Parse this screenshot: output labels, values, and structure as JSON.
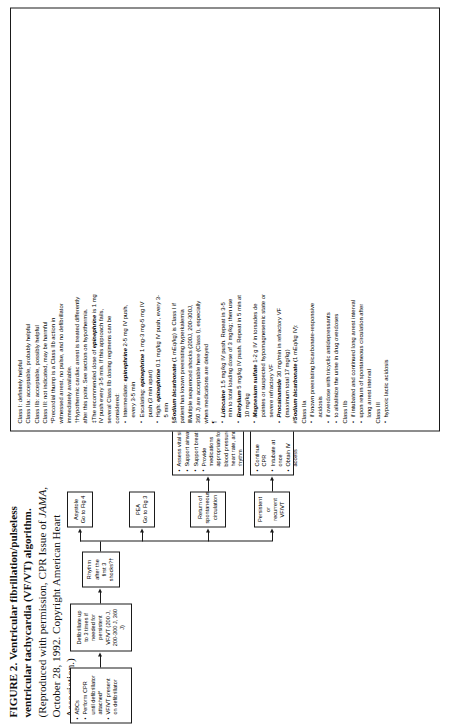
{
  "figure": {
    "label": "FIGURE 2.",
    "title": "Ventricular fibrillation/pulseless ventricular tachycardia (VF/VT) algorithm.",
    "credit_pre": "(Reproduced with permission, CPR Issue of ",
    "credit_italic": "JAMA,",
    "credit_post": " October 28, 1992. Copyright American Heart Association.)"
  },
  "flow": {
    "box1": {
      "items": [
        "ABCs",
        "Perform CPR until defibrillator attached*",
        "VF/VT present on defibrillator"
      ]
    },
    "box2": {
      "text": "Defibrillate up to 3 times if needed for persistent VF/VT (200 J, 200-300 J, 360 J)"
    },
    "box3": {
      "text": "Rhythm after the first 3 shocks?†"
    },
    "branch1": {
      "text": "Persistent or recurrent VF/VT"
    },
    "branch2": {
      "text": "Return of spontaneous circulation"
    },
    "branch3": {
      "line1": "PEA",
      "line2": "Go to Fig 3"
    },
    "branch4": {
      "line1": "Asystole",
      "line2": "Go to Fig 4"
    },
    "box_cpr": {
      "items": [
        "Continue CPR",
        "Intubate at once",
        "Obtain IV access"
      ]
    },
    "box_rosc": {
      "items": [
        "Assess vital signs",
        "Support airway",
        "Support breathing",
        "Provide medications appropriate for blood pressure, heart rate, and rhythm"
      ]
    },
    "box_epi": {
      "drug": "Epinephrine",
      "rest": " 1 mg IV push, ‡§ repeat every 3-5 min"
    },
    "box_defib360": {
      "text": "Defibrillate 360 J within 30-60 s‖"
    },
    "box_meds": {
      "text": "Administer medications of probable benefit (Class IIa) in persistent or recurrent VF/VT¶#"
    },
    "box_last": {
      "items": [
        "Defibrillate 360 J, 30-60 s after each dose of medication‖",
        "Patient should be drug-shock, drug-shock"
      ]
    }
  },
  "notes": {
    "classes": [
      "Class I: definitely helpful",
      "Class IIa: acceptable, probably helpful",
      "Class IIb: acceptable, possibly helpful",
      "Class III: not indicated, may be harmful"
    ],
    "star": "*Precordial thump is a Class IIb action in witnessed arrest, no pulse, and no defibrillator immediately available.",
    "dagger": "†Hypothermic cardiac arrest is treated differently after this point. See section on hypothermia.",
    "dbldagger_lead": "‡The recommended dose of ",
    "dbldagger_drug": "epinephrine",
    "dbldagger_rest": " is 1 mg IV push every 3-5 min. If this approach fails, several Class IIb dosing regimens can be considered:",
    "epi_regimens": [
      {
        "prefix": "Intermediate: ",
        "drug": "epinephrine",
        "rest": " 2-5 mg IV push, every 3-5 min"
      },
      {
        "prefix": "Escalating: ",
        "drug": "epinephrine",
        "rest": " 1 mg-3 mg-5 mg IV push (3 min apart)"
      },
      {
        "prefix": "High: ",
        "drug": "epinephrine",
        "rest": " 0.1 mg/kg IV push, every 3-5 min"
      }
    ],
    "section_lead": "§",
    "section_drug": "Sodium bicarbonate",
    "section_rest": " (1 mEq/kg) is Class I if patient has known preexisting hyperkalemia",
    "parallel": "‖Multiple sequenced shocks (200J, 200-300J, 360 J) are acceptable here (Class I), especially when medications are delayed",
    "pilcrow_drugs": [
      {
        "drug": "Lidocaine",
        "rest": " 1.5 mg/kg IV push. Repeat in 3-5 min to total loading dose of 3 mg/kg; then use"
      },
      {
        "drug": "Bretylium",
        "rest": " 5 mg/kg IV push. Repeat in 5 min at 10 mg/kg"
      },
      {
        "drug": "Magnesium sulfate",
        "rest": " 1-2 g IV in torsades de pointes or suspected hypomagnesemic state or severe refractory VF"
      },
      {
        "drug": "Procainamide",
        "rest": " 30 mg/min in refractory VF (maximum total 17 mg/kg)"
      }
    ],
    "hash_lead": "#",
    "hash_drug": "Sodium bicarbonate",
    "hash_rest": " (1 mEq/kg IV):",
    "class_iia_label": "Class IIa",
    "class_iia_items": [
      "if known preexisting bicarbonate-responsive acidosis",
      "if overdose with tricyclic antidepressants",
      "to alkalinize the urine in drug overdoses"
    ],
    "class_iib_label": "Class IIb",
    "class_iib_items": [
      "if intubated and continued long arrest interval",
      "upon return of spontaneous circulation after long arrest interval"
    ],
    "class_iii_label": "Class III",
    "class_iii_items": [
      "hypoxic lactic acidosis"
    ]
  }
}
